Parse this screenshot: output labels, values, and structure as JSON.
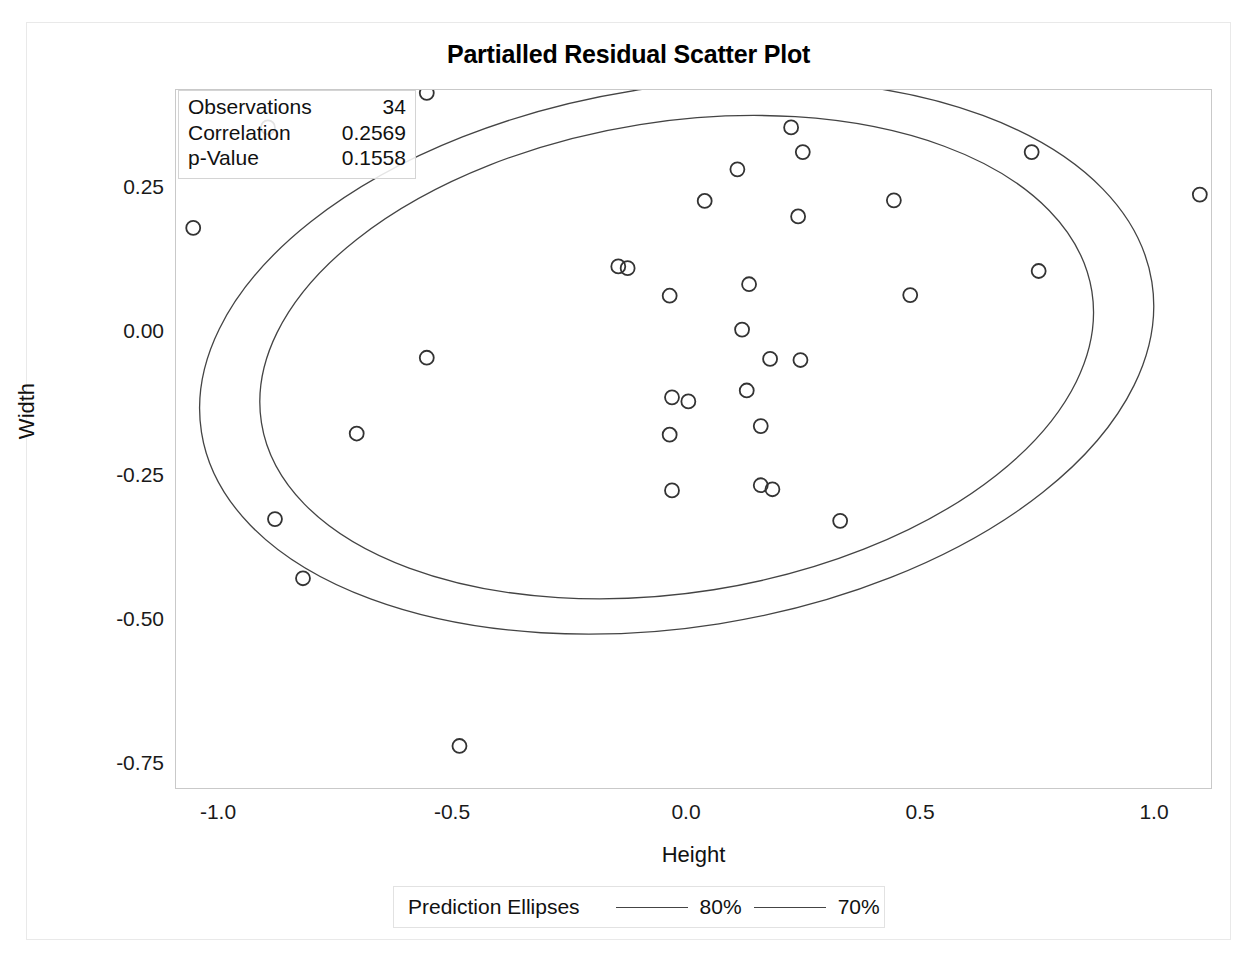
{
  "title": "Partialled Residual Scatter Plot",
  "axes": {
    "x_label": "Height",
    "y_label": "Width",
    "x_ticks": [
      "-1.0",
      "-0.5",
      "0.0",
      "0.5",
      "1.0"
    ],
    "y_ticks": [
      "0.25",
      "0.00",
      "-0.25",
      "-0.50",
      "-0.75"
    ]
  },
  "stats": {
    "rows": [
      {
        "name": "Observations",
        "value": "34"
      },
      {
        "name": "Correlation",
        "value": "0.2569"
      },
      {
        "name": "p-Value",
        "value": "0.1558"
      }
    ]
  },
  "legend": {
    "title": "Prediction Ellipses",
    "entries": [
      {
        "label": "80%"
      },
      {
        "label": "70%"
      }
    ]
  },
  "colors": {
    "marker_stroke": "#333333",
    "ellipse_stroke": "#444444",
    "frame": "#c9c9c9",
    "text": "#111111"
  },
  "chart_data": {
    "type": "scatter",
    "title": "Partialled Residual Scatter Plot",
    "xlabel": "Height",
    "ylabel": "Width",
    "xlim": [
      -1.13,
      1.17
    ],
    "ylim": [
      -0.83,
      0.44
    ],
    "grid": false,
    "legend_position": "bottom",
    "n_observations": 34,
    "correlation": 0.2569,
    "p_value": 0.1558,
    "marker": "open-circle",
    "series": [
      {
        "name": "Observations",
        "points": [
          [
            -1.055,
            0.18
          ],
          [
            -0.895,
            0.355
          ],
          [
            -0.555,
            0.415
          ],
          [
            -0.555,
            -0.046
          ],
          [
            -0.705,
            -0.178
          ],
          [
            -0.88,
            -0.327
          ],
          [
            -0.82,
            -0.43
          ],
          [
            -0.485,
            -0.722
          ],
          [
            -0.145,
            0.113
          ],
          [
            -0.125,
            0.11
          ],
          [
            -0.035,
            0.062
          ],
          [
            -0.03,
            -0.115
          ],
          [
            0.005,
            -0.122
          ],
          [
            -0.035,
            -0.18
          ],
          [
            -0.03,
            -0.277
          ],
          [
            0.04,
            0.227
          ],
          [
            0.11,
            0.282
          ],
          [
            0.12,
            0.003
          ],
          [
            0.13,
            -0.103
          ],
          [
            0.16,
            -0.165
          ],
          [
            0.16,
            -0.268
          ],
          [
            0.185,
            -0.275
          ],
          [
            0.135,
            0.082
          ],
          [
            0.18,
            -0.048
          ],
          [
            0.225,
            0.355
          ],
          [
            0.25,
            0.312
          ],
          [
            0.24,
            0.2
          ],
          [
            0.245,
            -0.05
          ],
          [
            0.33,
            -0.33
          ],
          [
            0.445,
            0.228
          ],
          [
            0.48,
            0.063
          ],
          [
            0.74,
            0.312
          ],
          [
            0.755,
            0.105
          ],
          [
            1.1,
            0.238
          ]
        ]
      }
    ],
    "ellipses": [
      {
        "label": "80%",
        "level": 0.8,
        "cx": -0.02,
        "cy": -0.045,
        "rx": 1.03,
        "ry": 0.47,
        "rotation_deg": -9
      },
      {
        "label": "70%",
        "level": 0.7,
        "cx": -0.02,
        "cy": -0.045,
        "rx": 0.9,
        "ry": 0.41,
        "rotation_deg": -9
      }
    ]
  }
}
